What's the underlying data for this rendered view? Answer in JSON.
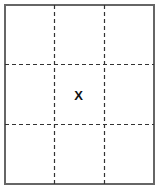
{
  "diagram": {
    "type": "3x3 dashed grid",
    "rows": 3,
    "columns": 3,
    "border_color": "#666666",
    "dash_color": "#333333",
    "cells": [
      [
        "",
        "",
        ""
      ],
      [
        "",
        "X",
        ""
      ],
      [
        "",
        "",
        ""
      ]
    ],
    "mark": {
      "label": "X",
      "row": 1,
      "column": 1,
      "color": "#111111"
    }
  }
}
